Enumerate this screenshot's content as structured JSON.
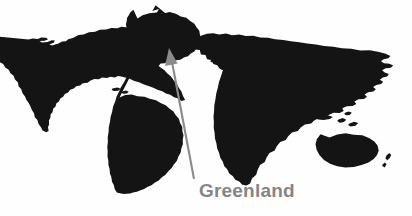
{
  "figure": {
    "type": "world-map-silhouette-with-callout",
    "width": 412,
    "height": 216,
    "background_color": "#fefefe",
    "land_color": "#141414",
    "annotation_color": "#8b8b8b"
  },
  "map": {
    "title": "",
    "projection_note": "",
    "landmasses": [
      "North America",
      "Greenland",
      "South America",
      "Europe",
      "Africa",
      "Asia",
      "Australia",
      "New Zealand",
      "Japan",
      "Indonesia",
      "Madagascar",
      "Iceland",
      "British Isles"
    ]
  },
  "annotation": {
    "label": "Greenland",
    "label_color": "#858585",
    "target": "Greenland",
    "arrow": {
      "tail_x": 194,
      "tail_y": 179,
      "tip_x": 169,
      "tip_y": 48,
      "color": "#8b8b8b"
    }
  }
}
